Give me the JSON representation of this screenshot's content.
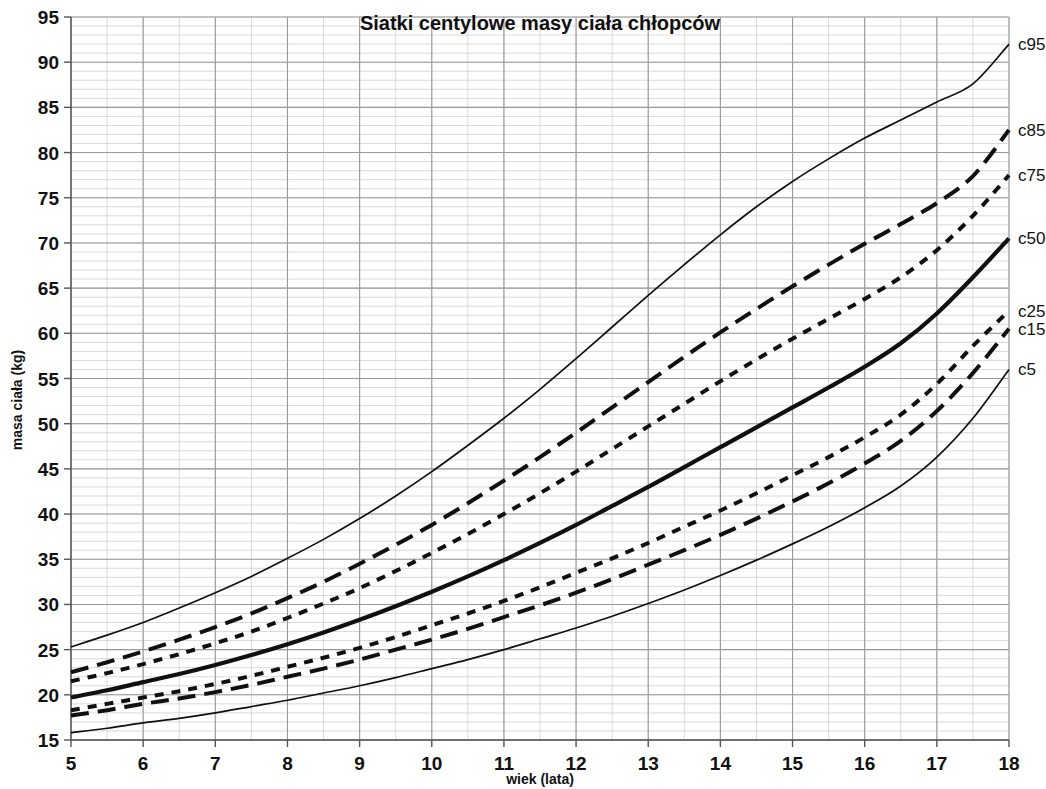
{
  "chart_data": {
    "type": "line",
    "title": "Siatki centylowe masy ciała chłopców",
    "xlabel": "wiek (lata)",
    "ylabel": "masa ciała (kg)",
    "xlim": [
      5,
      18
    ],
    "ylim": [
      15,
      95
    ],
    "x_ticks": [
      5,
      6,
      7,
      8,
      9,
      10,
      11,
      12,
      13,
      14,
      15,
      16,
      17,
      18
    ],
    "y_ticks": [
      15,
      20,
      25,
      30,
      35,
      40,
      45,
      50,
      55,
      60,
      65,
      70,
      75,
      80,
      85,
      90,
      95
    ],
    "grid": true,
    "grid_minor_y_step": 1,
    "grid_minor_x_step": 0.5,
    "legend_position": "right-inline",
    "x": [
      5,
      5.5,
      6,
      6.5,
      7,
      7.5,
      8,
      8.5,
      9,
      9.5,
      10,
      10.5,
      11,
      11.5,
      12,
      12.5,
      13,
      13.5,
      14,
      14.5,
      15,
      15.5,
      16,
      16.5,
      17,
      17.5,
      18
    ],
    "series": [
      {
        "name": "c95",
        "style": "thin-solid",
        "values": [
          25.3,
          26.6,
          28.0,
          29.6,
          31.3,
          33.1,
          35.1,
          37.2,
          39.5,
          42.0,
          44.7,
          47.6,
          50.6,
          53.8,
          57.2,
          60.7,
          64.2,
          67.6,
          70.9,
          74.0,
          76.8,
          79.3,
          81.6,
          83.6,
          85.6,
          87.6,
          92.0
        ]
      },
      {
        "name": "c85",
        "style": "long-dash",
        "values": [
          22.5,
          23.6,
          24.8,
          26.1,
          27.5,
          29.0,
          30.7,
          32.5,
          34.5,
          36.6,
          38.8,
          41.2,
          43.7,
          46.3,
          49.0,
          51.8,
          54.6,
          57.4,
          60.1,
          62.7,
          65.2,
          67.6,
          69.9,
          72.1,
          74.4,
          77.4,
          82.5
        ]
      },
      {
        "name": "c75",
        "style": "short-dash",
        "values": [
          21.5,
          22.4,
          23.4,
          24.5,
          25.7,
          27.0,
          28.5,
          30.1,
          31.8,
          33.7,
          35.7,
          37.8,
          40.0,
          42.3,
          44.7,
          47.2,
          49.7,
          52.2,
          54.7,
          57.1,
          59.4,
          61.6,
          63.8,
          66.2,
          69.2,
          73.0,
          77.5
        ]
      },
      {
        "name": "c50",
        "style": "thick-solid",
        "values": [
          19.7,
          20.5,
          21.4,
          22.3,
          23.3,
          24.4,
          25.6,
          26.9,
          28.3,
          29.8,
          31.4,
          33.1,
          34.9,
          36.8,
          38.8,
          40.9,
          43.0,
          45.2,
          47.4,
          49.6,
          51.8,
          54.0,
          56.3,
          58.9,
          62.2,
          66.2,
          70.5
        ]
      },
      {
        "name": "c25",
        "style": "short-dash",
        "values": [
          18.3,
          19.0,
          19.7,
          20.4,
          21.2,
          22.1,
          23.1,
          24.1,
          25.2,
          26.4,
          27.7,
          29.0,
          30.4,
          31.9,
          33.5,
          35.1,
          36.8,
          38.6,
          40.4,
          42.3,
          44.3,
          46.3,
          48.5,
          51.0,
          54.4,
          58.6,
          62.5
        ]
      },
      {
        "name": "c15",
        "style": "long-dash",
        "values": [
          17.7,
          18.3,
          19.0,
          19.6,
          20.3,
          21.1,
          22.0,
          22.9,
          23.9,
          25.0,
          26.1,
          27.3,
          28.6,
          29.9,
          31.3,
          32.8,
          34.4,
          36.0,
          37.7,
          39.5,
          41.4,
          43.4,
          45.6,
          48.1,
          51.4,
          55.6,
          60.5
        ]
      },
      {
        "name": "c5",
        "style": "thin-solid",
        "values": [
          15.8,
          16.3,
          16.9,
          17.4,
          18.0,
          18.7,
          19.4,
          20.2,
          21.0,
          21.9,
          22.9,
          23.9,
          25.0,
          26.2,
          27.4,
          28.7,
          30.1,
          31.6,
          33.2,
          34.9,
          36.7,
          38.6,
          40.7,
          43.1,
          46.3,
          50.6,
          56.0
        ]
      }
    ]
  },
  "labels": {
    "c95": "c95",
    "c85": "c85",
    "c75": "c75",
    "c50": "c50",
    "c25": "c25",
    "c15": "c15",
    "c5": "c5"
  },
  "colors": {
    "line": "#101010",
    "grid_major": "#9a9a9a",
    "grid_minor": "#cfcfcf",
    "axis": "#555555",
    "text": "#111111",
    "background": "#ffffff"
  }
}
